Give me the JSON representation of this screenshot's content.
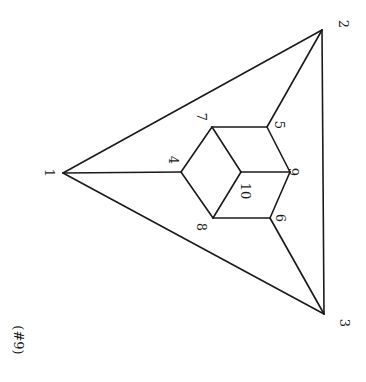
{
  "caption": "(#9)",
  "colors": {
    "background": "#ffffff",
    "ink": "#1a1a1a"
  },
  "vertices": [
    {
      "id": "1",
      "label": "1",
      "x": 63,
      "y": 173,
      "lx": 48,
      "ly": 173
    },
    {
      "id": "2",
      "label": "2",
      "x": 322,
      "y": 30,
      "lx": 342,
      "ly": 24
    },
    {
      "id": "3",
      "label": "3",
      "x": 324,
      "y": 314,
      "lx": 343,
      "ly": 323
    },
    {
      "id": "4",
      "label": "4",
      "x": 181,
      "y": 172,
      "lx": 172,
      "ly": 160
    },
    {
      "id": "5",
      "label": "5",
      "x": 267,
      "y": 127,
      "lx": 278,
      "ly": 125
    },
    {
      "id": "6",
      "label": "6",
      "x": 270,
      "y": 218,
      "lx": 279,
      "ly": 218
    },
    {
      "id": "7",
      "label": "7",
      "x": 212,
      "y": 127,
      "lx": 200,
      "ly": 117
    },
    {
      "id": "8",
      "label": "8",
      "x": 213,
      "y": 218,
      "lx": 200,
      "ly": 227
    },
    {
      "id": "9",
      "label": "9",
      "x": 290,
      "y": 172,
      "lx": 292,
      "ly": 172
    },
    {
      "id": "10",
      "label": "10",
      "x": 241,
      "y": 172,
      "lx": 244,
      "ly": 191
    }
  ],
  "edges": [
    [
      "1",
      "2"
    ],
    [
      "2",
      "3"
    ],
    [
      "3",
      "1"
    ],
    [
      "1",
      "4"
    ],
    [
      "2",
      "5"
    ],
    [
      "3",
      "6"
    ],
    [
      "4",
      "7"
    ],
    [
      "7",
      "5"
    ],
    [
      "5",
      "9"
    ],
    [
      "9",
      "6"
    ],
    [
      "6",
      "8"
    ],
    [
      "8",
      "4"
    ],
    [
      "7",
      "10"
    ],
    [
      "10",
      "9"
    ],
    [
      "10",
      "8"
    ]
  ]
}
